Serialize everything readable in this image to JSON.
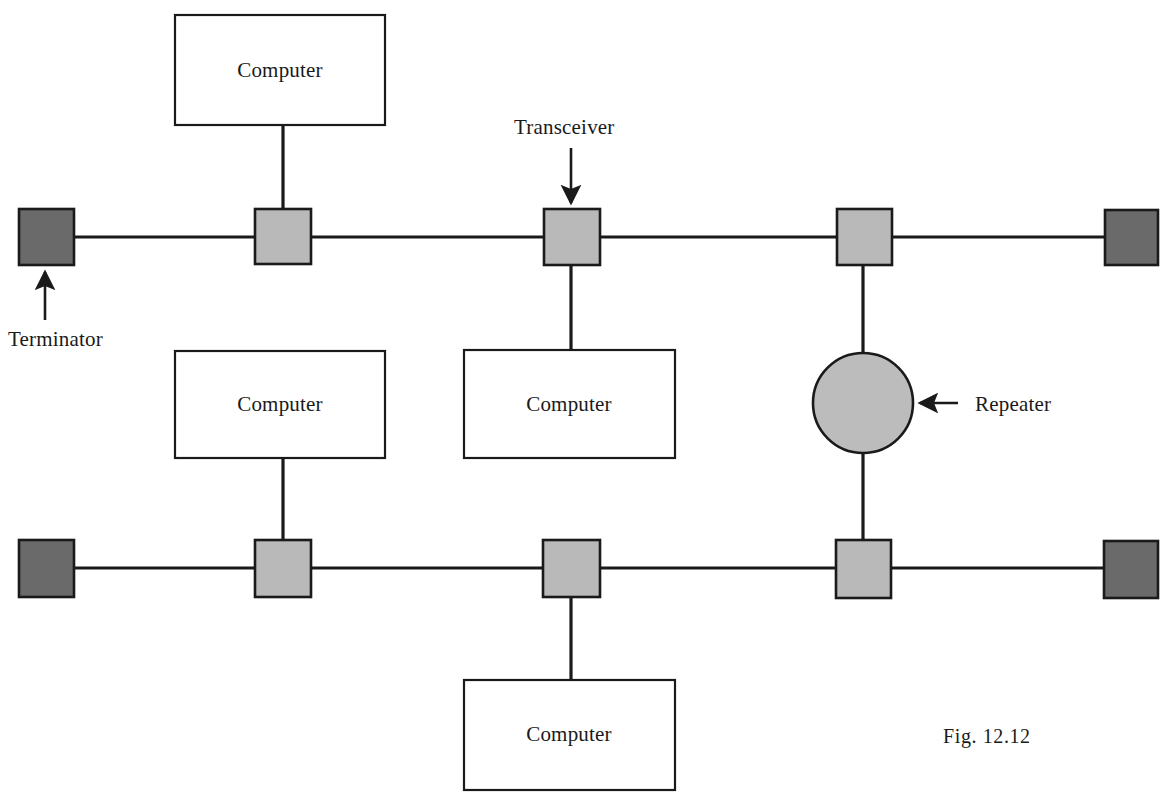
{
  "figure": {
    "caption": "Fig. 12.12",
    "caption_pos": {
      "x": 943,
      "y": 737
    }
  },
  "colors": {
    "line": "#1a1a1a",
    "terminator_fill": "#6a6a6a",
    "transceiver_fill": "#b9b9b9",
    "repeater_fill": "#bcbcbc",
    "computer_fill": "#ffffff",
    "stroke": "#1a1a1a",
    "text": "#1a1a1a",
    "background": "#ffffff"
  },
  "geometry": {
    "top_bus_y": 237,
    "bottom_bus_y": 568,
    "bus_left_x": 73,
    "bus_right_x": 1105,
    "terminator_size": 55,
    "transceiver_size": 56,
    "repeater_radius": 50,
    "computer_width": 210,
    "computer_height": 110
  },
  "buses": [
    {
      "name": "top-bus",
      "y": 237,
      "x1": 73,
      "x2": 1105
    },
    {
      "name": "bottom-bus",
      "y": 568,
      "x1": 74,
      "x2": 1104
    }
  ],
  "terminators": [
    {
      "id": "terminator-top-left",
      "label": "Terminator",
      "x": 19,
      "y": 209,
      "w": 55,
      "h": 56
    },
    {
      "id": "terminator-top-right",
      "label": "Terminator",
      "x": 1105,
      "y": 210,
      "w": 53,
      "h": 55
    },
    {
      "id": "terminator-bottom-left",
      "label": "Terminator",
      "x": 19,
      "y": 540,
      "w": 55,
      "h": 57
    },
    {
      "id": "terminator-bottom-right",
      "label": "Terminator",
      "x": 1104,
      "y": 541,
      "w": 54,
      "h": 57
    }
  ],
  "transceivers": [
    {
      "id": "transceiver-top-1",
      "x": 255,
      "y": 209,
      "w": 56,
      "h": 55,
      "stub": "up"
    },
    {
      "id": "transceiver-top-2",
      "x": 544,
      "y": 209,
      "w": 56,
      "h": 56,
      "stub": "down"
    },
    {
      "id": "transceiver-top-3",
      "x": 837,
      "y": 209,
      "w": 55,
      "h": 56,
      "stub": "down"
    },
    {
      "id": "transceiver-bottom-1",
      "x": 255,
      "y": 540,
      "w": 56,
      "h": 57,
      "stub": "up"
    },
    {
      "id": "transceiver-bottom-2",
      "x": 543,
      "y": 540,
      "w": 57,
      "h": 57,
      "stub": "down"
    },
    {
      "id": "transceiver-bottom-3",
      "x": 836,
      "y": 540,
      "w": 55,
      "h": 58,
      "stub": "up"
    }
  ],
  "computers": [
    {
      "id": "computer-top",
      "label": "Computer",
      "x": 175,
      "y": 15,
      "w": 210,
      "h": 110
    },
    {
      "id": "computer-middle-left",
      "label": "Computer",
      "x": 175,
      "y": 351,
      "w": 210,
      "h": 107
    },
    {
      "id": "computer-middle-center",
      "label": "Computer",
      "x": 464,
      "y": 350,
      "w": 211,
      "h": 108
    },
    {
      "id": "computer-bottom",
      "label": "Computer",
      "x": 464,
      "y": 680,
      "w": 211,
      "h": 110
    }
  ],
  "repeater": {
    "id": "repeater",
    "label": "Repeater",
    "cx": 863,
    "cy": 403,
    "r": 50
  },
  "connectors": [
    {
      "name": "computer-top-to-transceiver",
      "x": 283,
      "y1": 125,
      "y2": 209
    },
    {
      "name": "transceiver-to-computer-middle-center",
      "x": 571,
      "y1": 265,
      "y2": 350
    },
    {
      "name": "computer-middle-left-to-transceiver",
      "x": 283,
      "y1": 458,
      "y2": 540
    },
    {
      "name": "transceiver-to-computer-bottom",
      "x": 571,
      "y1": 597,
      "y2": 680
    },
    {
      "name": "repeater-to-top-bus",
      "x": 863,
      "y1": 265,
      "y2": 353
    },
    {
      "name": "repeater-to-bottom-bus",
      "x": 863,
      "y1": 453,
      "y2": 540
    }
  ],
  "callouts": [
    {
      "id": "callout-transceiver",
      "label": "Transceiver",
      "label_x": 516,
      "label_y": 116,
      "arrow": {
        "x1": 571,
        "y1": 150,
        "x2": 571,
        "y2": 205,
        "direction": "down"
      }
    },
    {
      "id": "callout-terminator",
      "label": "Terminator",
      "label_x": 8,
      "label_y": 327,
      "arrow": {
        "x1": 45,
        "y1": 320,
        "x2": 45,
        "y2": 270,
        "direction": "up"
      }
    },
    {
      "id": "callout-repeater",
      "label": "Repeater",
      "label_x": 975,
      "label_y": 392,
      "arrow": {
        "x1": 955,
        "y1": 403,
        "x2": 918,
        "y2": 403,
        "direction": "left"
      }
    }
  ]
}
